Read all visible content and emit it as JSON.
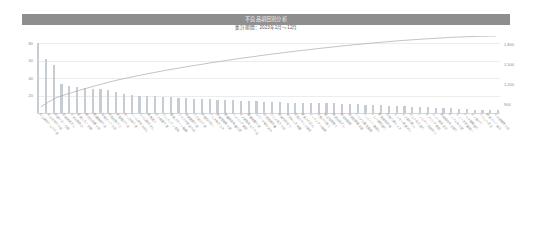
{
  "header": {
    "title": "不良品項目別分析",
    "subtitle": "集計期間：2023年1月～12月"
  },
  "axes": {
    "left_ticks": [
      "80",
      "60",
      "40",
      "20"
    ],
    "right_ticks": [
      "1,800",
      "1,500",
      "1,200",
      "900"
    ]
  },
  "colors": {
    "header_band": "#8e8e8e",
    "title_text": "#f2f2f2",
    "subtitle_text": "#5c5c5c",
    "bar": "#c6ccd4",
    "line": "#a9a9a9",
    "gridline": "#ececec",
    "axis_text": "#8a8a8a",
    "xlabel_text": "#9a9a9a"
  },
  "chart_data": {
    "type": "bar",
    "title": "不良品項目別分析",
    "subtitle": "集計期間：2023年1月～12月",
    "xlabel": "",
    "ylabel": "",
    "ylim": [
      0,
      88
    ],
    "y2lim": [
      780,
      1920
    ],
    "grid": true,
    "legend": "none",
    "left_tick_values": [
      80,
      60,
      40,
      20
    ],
    "right_tick_values": [
      1800,
      1500,
      1200,
      900
    ],
    "categories": [
      "ねじ締付トルク不足",
      "はんだ付け不良",
      "外観キズ・打痕",
      "部品実装ズレ",
      "寸法公差外れ",
      "塗装ムラ・色差",
      "組付け位置不良",
      "配線接続不良",
      "溶接ビード不良",
      "樹脂成形バリ",
      "表面粗さ不良",
      "めっき厚不足",
      "シール材はみ出し",
      "ラベル貼付ズレ",
      "異物混入",
      "圧入荷重不足",
      "ゴムパッキン変形",
      "基板パターン断線",
      "コネクタ嵌合不良",
      "焼結密度不足",
      "バネ反力不足",
      "研磨目不均一",
      "プレス抜きカス",
      "熱処理硬度不足",
      "接着剤塗布量不足",
      "ベアリング異音",
      "ギア歯面当たり不良",
      "潤滑油量不足",
      "Oリング噛み込み",
      "洗浄残渣付着",
      "カシメ高さ不良",
      "絶縁抵抗低下",
      "端子めっき剥離",
      "樹脂クラック発生",
      "座金入れ忘れ",
      "マーキング不鮮明",
      "切削バリ残り",
      "組立順序誤り",
      "検査治具ズレ",
      "梱包材破損",
      "取扱説明書欠品",
      "シリアル番号重複",
      "ワッシャー裏返し",
      "トレー識別誤り",
      "防錆油未塗布",
      "段取り替えミス",
      "センサー感度ズレ",
      "エア漏れ微少",
      "ボルト長さ誤り",
      "フィルター目詰まり",
      "スプリング座屈",
      "カバー嵌合浮き",
      "銘板取付向き誤り",
      "ケーブル長不足",
      "ヒューズ容量違い",
      "グリス種類誤り",
      "ピン曲がり",
      "リベット浮き",
      "結束バンド緩み",
      "その他軽微不良"
    ],
    "values": [
      80,
      62,
      55,
      33,
      31,
      30,
      29,
      28,
      27,
      26,
      24,
      22,
      21,
      20,
      19,
      19,
      18,
      18,
      17,
      17,
      16,
      16,
      16,
      15,
      15,
      15,
      14,
      14,
      14,
      13,
      13,
      13,
      12,
      12,
      12,
      11,
      11,
      11,
      11,
      10,
      10,
      10,
      9,
      9,
      9,
      8,
      8,
      8,
      7,
      7,
      7,
      6,
      6,
      6,
      5,
      5,
      4,
      4,
      3,
      3
    ],
    "cumulative_percent": [
      8.2,
      14.5,
      20.1,
      23.5,
      26.7,
      29.7,
      32.7,
      35.5,
      38.3,
      40.9,
      43.4,
      45.6,
      47.8,
      49.8,
      51.8,
      53.7,
      55.6,
      57.4,
      59.1,
      60.9,
      62.5,
      64.1,
      65.8,
      67.3,
      68.8,
      70.4,
      71.8,
      73.2,
      74.6,
      76.0,
      77.3,
      78.6,
      79.8,
      81.1,
      82.3,
      83.4,
      84.6,
      85.7,
      86.8,
      87.9,
      88.9,
      89.9,
      90.8,
      91.8,
      92.7,
      93.6,
      94.4,
      95.2,
      95.9,
      96.6,
      97.3,
      97.9,
      98.5,
      99.1,
      99.6,
      100.0,
      100.3,
      100.6,
      100.8,
      101.0
    ]
  }
}
